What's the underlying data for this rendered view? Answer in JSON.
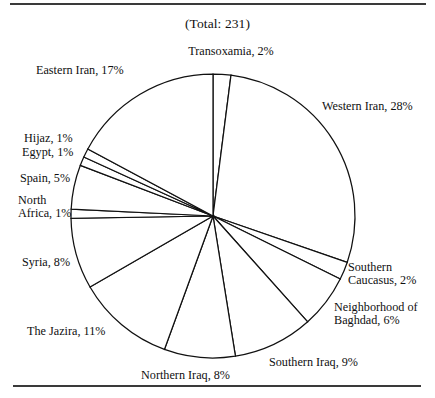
{
  "figure": {
    "title": "(Total: 231)",
    "background": "#ffffff",
    "line_color": "#111111",
    "slice_fill": "#ffffff",
    "rules": {
      "top": "horizontal-rule",
      "bottom": "horizontal-rule"
    }
  },
  "chart_data": {
    "type": "pie",
    "title": "(Total: 231)",
    "total": 231,
    "units": "%",
    "start_angle_deg": 0,
    "direction": "clockwise",
    "legend": "none",
    "labels_outside": true,
    "categories": [
      "Transoxamia",
      "Western Iran",
      "Southern Caucasus",
      "Neighborhood of Baghdad",
      "Southern Iraq",
      "Northern Iraq",
      "The Jazira",
      "Syria",
      "North Africa",
      "Spain",
      "Egypt",
      "Hijaz",
      "Eastern Iran"
    ],
    "values": [
      2,
      28,
      2,
      6,
      9,
      8,
      11,
      8,
      1,
      5,
      1,
      1,
      17
    ],
    "slices": [
      {
        "name": "Transoxamia",
        "value": 2,
        "label": "Transoxamia, 2%",
        "label_text": "Transoxamia, 2%",
        "label_x": 176,
        "label_y": 45,
        "label_align": "center",
        "label_width": 110
      },
      {
        "name": "Western Iran",
        "value": 28,
        "label": "Western Iran, 28%",
        "label_text": "Western Iran, 28%",
        "label_x": 322,
        "label_y": 100,
        "label_align": "left",
        "label_width": 113
      },
      {
        "name": "Southern Caucasus",
        "value": 2,
        "label": "Southern Caucasus, 2%",
        "label_text": "Southern\nCaucasus, 2%",
        "label_x": 348,
        "label_y": 261,
        "label_align": "left",
        "label_width": 90
      },
      {
        "name": "Neighborhood of Baghdad",
        "value": 6,
        "label": "Neighborhood of Baghdad, 6%",
        "label_text": "Neighborhood of\nBaghdad, 6%",
        "label_x": 334,
        "label_y": 301,
        "label_align": "left",
        "label_width": 104
      },
      {
        "name": "Southern Iraq",
        "value": 9,
        "label": "Southern Iraq, 9%",
        "label_text": "Southern Iraq, 9%",
        "label_x": 269,
        "label_y": 356,
        "label_align": "left",
        "label_width": 110
      },
      {
        "name": "Northern Iraq",
        "value": 8,
        "label": "Northern Iraq, 8%",
        "label_text": "Northern Iraq, 8%",
        "label_x": 141,
        "label_y": 369,
        "label_align": "left",
        "label_width": 112
      },
      {
        "name": "The Jazira",
        "value": 11,
        "label": "The Jazira, 11%",
        "label_text": "The Jazira, 11%",
        "label_x": 27,
        "label_y": 325,
        "label_align": "left",
        "label_width": 100
      },
      {
        "name": "Syria",
        "value": 8,
        "label": "Syria, 8%",
        "label_text": "Syria, 8%",
        "label_x": 22,
        "label_y": 256,
        "label_align": "left",
        "label_width": 70
      },
      {
        "name": "North Africa",
        "value": 1,
        "label": "North Africa, 1%",
        "label_text": "North\nAfrica, 1%",
        "label_x": 18,
        "label_y": 194,
        "label_align": "left",
        "label_width": 72
      },
      {
        "name": "Spain",
        "value": 5,
        "label": "Spain, 5%",
        "label_text": "Spain, 5%",
        "label_x": 20,
        "label_y": 172,
        "label_align": "left",
        "label_width": 70
      },
      {
        "name": "Egypt",
        "value": 1,
        "label": "Egypt, 1%",
        "label_text": "Egypt, 1%",
        "label_x": 22,
        "label_y": 146,
        "label_align": "left",
        "label_width": 70
      },
      {
        "name": "Hijaz",
        "value": 1,
        "label": "Hijaz, 1%",
        "label_text": "Hijaz, 1%",
        "label_x": 24,
        "label_y": 132,
        "label_align": "left",
        "label_width": 70
      },
      {
        "name": "Eastern Iran",
        "value": 17,
        "label": "Eastern Iran, 17%",
        "label_text": "Eastern Iran, 17%",
        "label_x": 36,
        "label_y": 64,
        "label_align": "left",
        "label_width": 115
      }
    ],
    "geometry": {
      "center_x": 213,
      "center_y": 216,
      "radius": 142
    }
  }
}
